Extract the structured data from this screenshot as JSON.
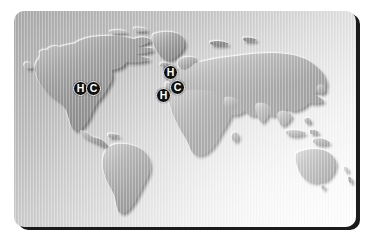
{
  "figure": {
    "type": "world-map-graphic",
    "card": {
      "background_gradient_from": "#a9a9a9",
      "background_gradient_to": "#fdfdfd",
      "shadow_color": "#1b1b1b",
      "corner_radius_px": 10
    },
    "land_fill": "#8f8f8f",
    "land_highlight": "#d8d8d8",
    "land_shadow": "#2e2e2e"
  },
  "markers": [
    {
      "label": "H",
      "region": "north-america",
      "x": 59,
      "y": 70
    },
    {
      "label": "C",
      "region": "north-america",
      "x": 72,
      "y": 70
    },
    {
      "label": "H",
      "region": "europe-north",
      "x": 149,
      "y": 54
    },
    {
      "label": "C",
      "region": "europe-central",
      "x": 156,
      "y": 69
    },
    {
      "label": "H",
      "region": "europe-southwest",
      "x": 142,
      "y": 77
    }
  ],
  "marker_legend": {
    "H": "H",
    "C": "C"
  }
}
